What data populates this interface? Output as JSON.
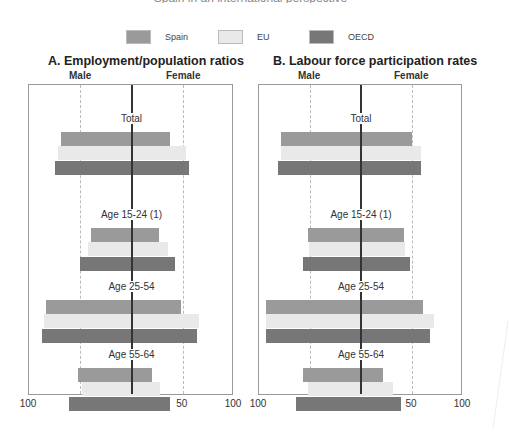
{
  "clipped_heading": "Spain in an international perspective",
  "legend": [
    {
      "name": "Spain",
      "color": "#9a9a9a"
    },
    {
      "name": "EU",
      "color": "#e9e9e9"
    },
    {
      "name": "OECD",
      "color": "#777777"
    }
  ],
  "side_labels": {
    "left": "Male",
    "right": "Female"
  },
  "ticks": [
    "100",
    "50",
    "0",
    "50",
    "100"
  ],
  "chart_data": [
    {
      "type": "bar",
      "orientation": "horizontal-diverging",
      "title": "A.  Employment/population ratios",
      "xlabel_left": "Male",
      "xlabel_right": "Female",
      "xlim": [
        -100,
        100
      ],
      "xticks": [
        100,
        50,
        0,
        50,
        100
      ],
      "grid": "dashed at ±50",
      "categories": [
        "Total",
        "Age 15-24 (1)",
        "Age 25-54",
        "Age 55-64"
      ],
      "series": [
        {
          "name": "Spain",
          "male": [
            69,
            40,
            83,
            52
          ],
          "female": [
            38,
            27,
            48,
            20
          ]
        },
        {
          "name": "EU",
          "male": [
            72,
            42,
            85,
            48
          ],
          "female": [
            53,
            36,
            66,
            28
          ]
        },
        {
          "name": "OECD",
          "male": [
            75,
            50,
            87,
            61
          ],
          "female": [
            56,
            42,
            64,
            38
          ]
        }
      ]
    },
    {
      "type": "bar",
      "orientation": "horizontal-diverging",
      "title": "B.  Labour force participation rates",
      "xlabel_left": "Male",
      "xlabel_right": "Female",
      "xlim": [
        -100,
        100
      ],
      "xticks": [
        100,
        50,
        0,
        50,
        100
      ],
      "grid": "dashed at ±50",
      "categories": [
        "Total",
        "Age 15-24 (1)",
        "Age 25-54",
        "Age 55-64"
      ],
      "series": [
        {
          "name": "Spain",
          "male": [
            78,
            52,
            93,
            57
          ],
          "female": [
            50,
            42,
            61,
            22
          ]
        },
        {
          "name": "EU",
          "male": [
            78,
            51,
            93,
            52
          ],
          "female": [
            59,
            43,
            72,
            31
          ]
        },
        {
          "name": "OECD",
          "male": [
            81,
            57,
            93,
            64
          ],
          "female": [
            59,
            48,
            68,
            39
          ]
        }
      ]
    }
  ]
}
